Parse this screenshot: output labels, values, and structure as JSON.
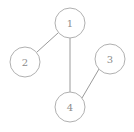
{
  "diagram": {
    "type": "undirected-graph",
    "background_color": "#ffffff",
    "node_stroke_color": "#b0b0b0",
    "node_fill_color": "#ffffff",
    "edge_stroke_color": "#9a9a9a",
    "label_color": "#8c8c8c",
    "node_radius": 15,
    "nodes": [
      {
        "id": "1",
        "label": "1",
        "cx": 70,
        "cy": 23
      },
      {
        "id": "2",
        "label": "2",
        "cx": 25,
        "cy": 62
      },
      {
        "id": "3",
        "label": "3",
        "cx": 110,
        "cy": 59
      },
      {
        "id": "4",
        "label": "4",
        "cx": 70,
        "cy": 107
      }
    ],
    "edges": [
      {
        "id": "edge-1-2",
        "source": "1",
        "target": "2",
        "x1": 58,
        "y1": 33,
        "x2": 37,
        "y2": 52
      },
      {
        "id": "edge-1-4",
        "source": "1",
        "target": "4",
        "x1": 70,
        "y1": 38,
        "x2": 70,
        "y2": 92
      },
      {
        "id": "edge-3-4",
        "source": "3",
        "target": "4",
        "x1": 99,
        "y1": 69,
        "x2": 82,
        "y2": 98
      }
    ]
  }
}
